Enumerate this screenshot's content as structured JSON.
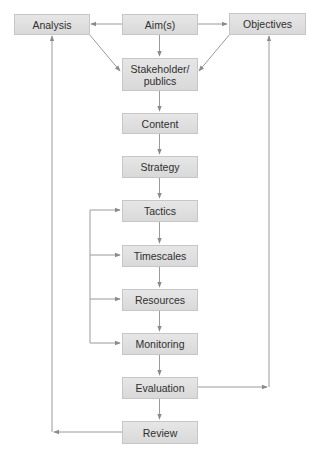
{
  "diagram": {
    "type": "flowchart",
    "nodes": [
      {
        "id": "analysis",
        "label": "Analysis"
      },
      {
        "id": "aims",
        "label": "Aim(s)"
      },
      {
        "id": "objectives",
        "label": "Objectives"
      },
      {
        "id": "stakeholder",
        "label": "Stakeholder/\npublics"
      },
      {
        "id": "content",
        "label": "Content"
      },
      {
        "id": "strategy",
        "label": "Strategy"
      },
      {
        "id": "tactics",
        "label": "Tactics"
      },
      {
        "id": "timescales",
        "label": "Timescales"
      },
      {
        "id": "resources",
        "label": "Resources"
      },
      {
        "id": "monitoring",
        "label": "Monitoring"
      },
      {
        "id": "evaluation",
        "label": "Evaluation"
      },
      {
        "id": "review",
        "label": "Review"
      }
    ],
    "stakeholder_lines": [
      "Stakeholder/",
      "publics"
    ],
    "edges": [
      {
        "from": "aims",
        "to": "analysis"
      },
      {
        "from": "aims",
        "to": "objectives"
      },
      {
        "from": "aims",
        "to": "stakeholder"
      },
      {
        "from": "analysis",
        "to": "stakeholder"
      },
      {
        "from": "objectives",
        "to": "stakeholder"
      },
      {
        "from": "stakeholder",
        "to": "content"
      },
      {
        "from": "content",
        "to": "strategy"
      },
      {
        "from": "strategy",
        "to": "tactics"
      },
      {
        "from": "tactics",
        "to": "timescales"
      },
      {
        "from": "timescales",
        "to": "resources"
      },
      {
        "from": "resources",
        "to": "monitoring"
      },
      {
        "from": "monitoring",
        "to": "evaluation"
      },
      {
        "from": "evaluation",
        "to": "review"
      },
      {
        "from": "monitoring",
        "to": "tactics",
        "note": "feedback loop"
      },
      {
        "from": "monitoring",
        "to": "timescales",
        "note": "feedback loop"
      },
      {
        "from": "monitoring",
        "to": "resources",
        "note": "feedback loop"
      },
      {
        "from": "evaluation",
        "to": "objectives"
      },
      {
        "from": "review",
        "to": "analysis"
      }
    ],
    "colors": {
      "box_fill": "#e0e0e0",
      "box_border": "#c6c6c6",
      "text": "#2f2f2f",
      "line": "#8a8a8a"
    }
  }
}
